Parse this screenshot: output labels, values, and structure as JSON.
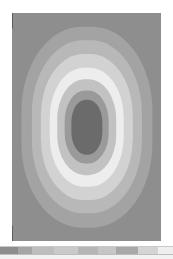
{
  "plot": {
    "type": "contour",
    "background_color": "#8e8e8e",
    "frame": {
      "x": 12,
      "y": 13,
      "width": 149,
      "height": 228
    },
    "corner_color": "#2e2e2e",
    "labels": {
      "max_marker": "MX",
      "min_max_marker": "MNX"
    }
  },
  "chart_data": {
    "type": "heatmap",
    "title": "",
    "subtitle": "",
    "xlabel": "",
    "ylabel": "",
    "grid": false,
    "legend_position": "bottom",
    "contour_bands": [
      {
        "index": 1,
        "label": "outer",
        "color": "#8e8e8e",
        "rx": 100,
        "ry": 100
      },
      {
        "index": 2,
        "label": "band-2",
        "color": "#a3a3a3",
        "rx": 88,
        "ry": 88
      },
      {
        "index": 3,
        "label": "band-3",
        "color": "#b8b8b8",
        "rx": 74,
        "ry": 76
      },
      {
        "index": 4,
        "label": "band-4",
        "color": "#d2d2d2",
        "rx": 62,
        "ry": 64
      },
      {
        "index": 5,
        "label": "band-5",
        "color": "#ededed",
        "rx": 50,
        "ry": 52
      },
      {
        "index": 6,
        "label": "band-6",
        "color": "#c2c2c2",
        "rx": 40,
        "ry": 42
      },
      {
        "index": 7,
        "label": "band-7",
        "color": "#9a9a9a",
        "rx": 30,
        "ry": 32
      },
      {
        "index": 8,
        "label": "peak",
        "color": "#6b6b6b",
        "rx": 21,
        "ry": 24
      }
    ],
    "legend_swatches": [
      {
        "index": 1,
        "color": "#8d8d8d",
        "width": 18
      },
      {
        "index": 2,
        "color": "#a5a5a5",
        "width": 14
      },
      {
        "index": 3,
        "color": "#bdbdbd",
        "width": 22
      },
      {
        "index": 4,
        "color": "#c9c9c9",
        "width": 24
      },
      {
        "index": 5,
        "color": "#b5b5b5",
        "width": 20
      },
      {
        "index": 6,
        "color": "#c6c6c6",
        "width": 18
      },
      {
        "index": 7,
        "color": "#a8a8a8",
        "width": 22
      },
      {
        "index": 8,
        "color": "#d4d4d4",
        "width": 20
      },
      {
        "index": 9,
        "color": "#efefef",
        "width": 15
      }
    ]
  }
}
